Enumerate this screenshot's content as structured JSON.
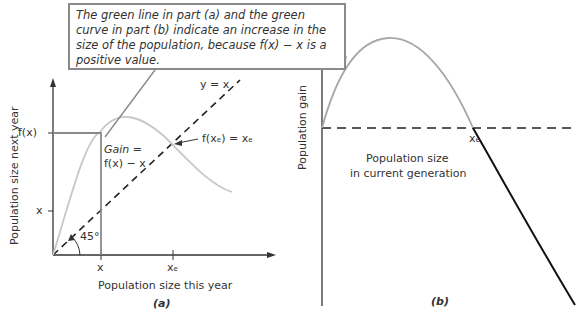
{
  "callout": {
    "text": "The green line in part (a) and the green curve in part (b) indicate an increase in the size of the population, because f(x) − x is a positive value."
  },
  "panel_a": {
    "caption": "(a)",
    "ylabel": "Population size next year",
    "xlabel": "Population size this year",
    "tick_fx": "f(x)",
    "tick_x_y": "x",
    "tick_x": "x",
    "tick_xe": "xₑ",
    "line_label": "y = x",
    "equilibrium_label": "f(xₑ) = xₑ",
    "gain_label_1": "Gain =",
    "gain_label_2": "f(x) − x",
    "angle_label": "45°"
  },
  "panel_b": {
    "caption": "(b)",
    "ylabel": "Population gain",
    "xe_label": "xₑ",
    "xlabel_line1": "Population size",
    "xlabel_line2": "in current generation"
  },
  "colors": {
    "curve": "#c8c8c8",
    "callout_line": "#8a8a8a",
    "axes": "#333333",
    "negative_curve": "#111111"
  }
}
